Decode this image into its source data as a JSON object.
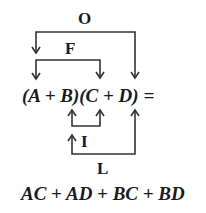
{
  "diagram": {
    "brackets": {
      "outer": {
        "label": "O"
      },
      "first": {
        "label": "F"
      },
      "inner": {
        "label": "I"
      },
      "last": {
        "label": "L"
      }
    },
    "expression": {
      "text": "(A + B)(C + D) ="
    },
    "result": {
      "text": "AC + AD + BC + BD"
    },
    "colors": {
      "stroke": "#333333",
      "text": "#1a1a1a",
      "background": "#ffffff"
    }
  }
}
